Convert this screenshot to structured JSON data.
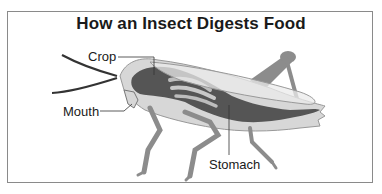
{
  "title": "How an Insect Digests Food",
  "labels": {
    "crop": "Crop",
    "mouth": "Mouth",
    "stomach": "Stomach"
  },
  "colors": {
    "body": "#d7d7d7",
    "digestive_tract": "#555555",
    "legs": "#8c8c8c",
    "wing": "#e6e6e6",
    "outline": "#888888",
    "text": "#1a1a1a"
  }
}
